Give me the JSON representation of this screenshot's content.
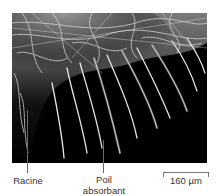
{
  "figure": {
    "labels": {
      "root": "Racine",
      "root_hair_line1": "Poil",
      "root_hair_line2": "absorbant",
      "scale": "160 µm"
    }
  }
}
